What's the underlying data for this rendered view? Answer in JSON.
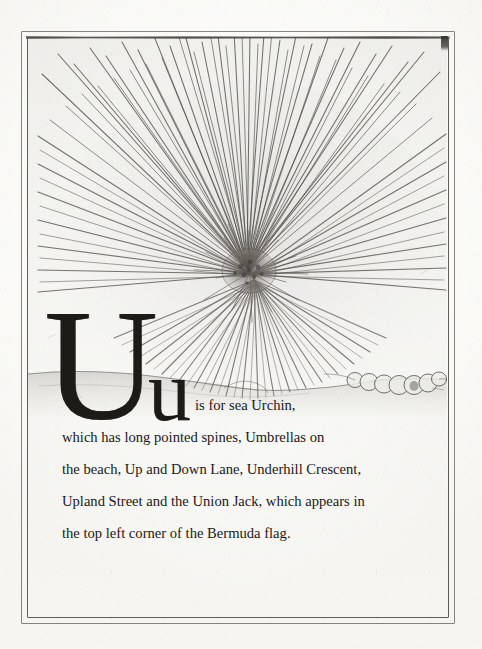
{
  "page": {
    "title": "U is for sea Urchin",
    "letter_upper": "U",
    "letter_lower": "u",
    "background_color": "#fbfbf9",
    "ink_color": "#1d1b18",
    "frame_color": "#4a4842"
  },
  "illustration": {
    "subject": "sea-urchin",
    "description": "Pencil and etching style drawing of a sea urchin with long radiating spines resting on a sand line, with a row of small pebbles or shells to the right",
    "elements": [
      {
        "name": "urchin-body",
        "center_x": 247,
        "center_y": 268,
        "radius": 26
      },
      {
        "name": "urchin-spines",
        "count": 132,
        "max_length": 250
      },
      {
        "name": "sand-line",
        "from_x": 28,
        "to_x": 453,
        "y": 380
      },
      {
        "name": "pebble-row",
        "count": 7,
        "from_x": 352,
        "to_x": 432,
        "y": 378
      }
    ]
  },
  "caption": {
    "lines": [
      "is for sea Urchin,",
      "which has long pointed spines, Umbrellas on",
      "the beach, Up and Down Lane, Underhill Crescent,",
      "Upland Street and the Union Jack, which appears in",
      "the top left corner of the Bermuda flag."
    ]
  }
}
